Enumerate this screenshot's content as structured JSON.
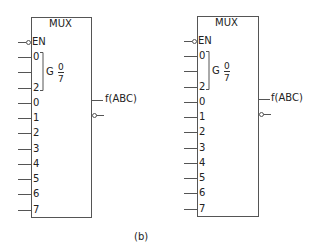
{
  "caption": "(b)",
  "muxes": [
    {
      "title": "MUX",
      "enable": "EN",
      "select_inputs": [
        "0",
        "",
        "2"
      ],
      "select_group": {
        "letter": "G",
        "numerator": "0",
        "denominator": "7"
      },
      "data_inputs": [
        "0",
        "1",
        "2",
        "3",
        "4",
        "5",
        "6",
        "7"
      ],
      "output_label": "f(ABC)"
    },
    {
      "title": "MUX",
      "enable": "EN",
      "select_inputs": [
        "0",
        "",
        "2"
      ],
      "select_group": {
        "letter": "G",
        "numerator": "0",
        "denominator": "7"
      },
      "data_inputs": [
        "0",
        "1",
        "2",
        "3",
        "4",
        "5",
        "6",
        "7"
      ],
      "output_label": "f(ABC)"
    }
  ]
}
